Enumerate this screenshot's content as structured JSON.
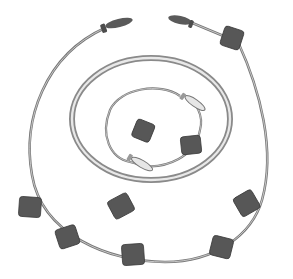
{
  "image": {
    "description": "Illustration of jump ropes and bean bags arranged in concentric circles",
    "colors": {
      "background": "#ffffff",
      "rope": "#7a7a7a",
      "rope_highlight": "#d8d8d8",
      "hoop": "#8a8a8a",
      "hoop_inner": "#e6e6e6",
      "handle_dark": "#555555",
      "handle_light": "#e4e4e4",
      "beanbag": "#565656",
      "beanbag_edge": "#3a3a3a"
    },
    "objects": {
      "outer_jump_rope": {
        "handle_color": "dark"
      },
      "hoop": {
        "type": "ring"
      },
      "inner_jump_rope": {
        "handle_color": "light"
      },
      "bean_bag_count": 10
    }
  }
}
